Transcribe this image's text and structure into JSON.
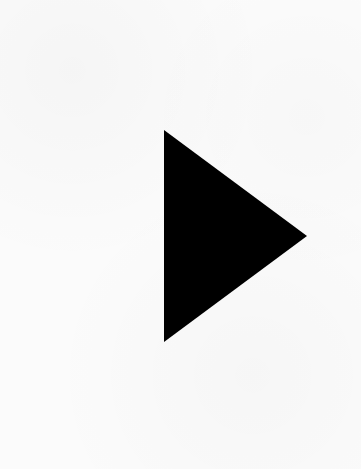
{
  "canvas": {
    "width": 361,
    "height": 469,
    "background_color": "#fbfbfb"
  },
  "play_icon": {
    "icon": "play-triangle",
    "color": "#000000",
    "points": [
      [
        164,
        130
      ],
      [
        164,
        342
      ],
      [
        307,
        236
      ]
    ]
  }
}
